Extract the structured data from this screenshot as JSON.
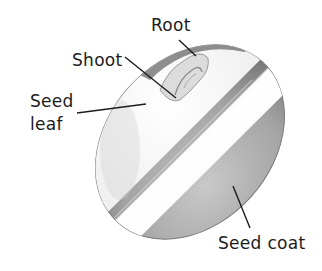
{
  "diagram": {
    "labels": {
      "root": "Root",
      "shoot": "Shoot",
      "seed_leaf_line1": "Seed",
      "seed_leaf_line2": "leaf",
      "seed_coat": "Seed coat"
    },
    "colors": {
      "text": "#1c1c1c",
      "leader_line": "#1c1c1c",
      "seed_coat_dark": "#8a8a8a",
      "seed_leaf_light": "#f4f4f4"
    }
  }
}
